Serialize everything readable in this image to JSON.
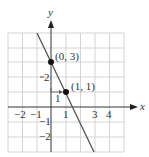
{
  "figure": {
    "axis_labels": {
      "x": "x",
      "y": "y"
    },
    "x_ticks": [
      {
        "value": -2,
        "label": "−2"
      },
      {
        "value": -1,
        "label": "−1"
      },
      {
        "value": 1,
        "label": "1"
      },
      {
        "value": 3,
        "label": "3"
      },
      {
        "value": 4,
        "label": "4"
      }
    ],
    "y_ticks": [
      {
        "value": 2,
        "label": "2"
      },
      {
        "value": -1,
        "label": "−1"
      },
      {
        "value": -2,
        "label": "−2"
      }
    ],
    "points": [
      {
        "x": 0,
        "y": 3,
        "label": "(0, 3)"
      },
      {
        "x": 1,
        "y": 1,
        "label": "(1, 1)"
      }
    ],
    "run_label": "1",
    "colors": {
      "grid": "#d4d4d4",
      "axis": "#333333",
      "line": "#555555",
      "point": "#111111"
    }
  }
}
